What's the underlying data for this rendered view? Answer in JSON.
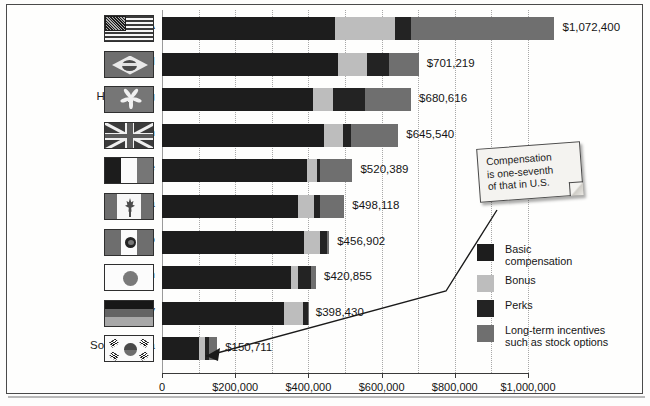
{
  "chart_data": {
    "type": "bar",
    "orientation": "horizontal",
    "stacked": true,
    "title": "",
    "xlabel": "",
    "ylabel": "",
    "xlim": [
      0,
      1100000
    ],
    "grid": true,
    "legend_position": "right",
    "categories": [
      "USA",
      "Brazil",
      "Hong Kong",
      "Britain",
      "France",
      "Canada",
      "Mexico",
      "Japan",
      "Germany",
      "South Korea"
    ],
    "totals": [
      1072400,
      701219,
      680616,
      645540,
      520389,
      498118,
      456902,
      420855,
      398430,
      150711
    ],
    "total_labels": [
      "$1,072,400",
      "$701,219",
      "$680,616",
      "$645,540",
      "$520,389",
      "$498,118",
      "$456,902",
      "$420,855",
      "$398,430",
      "$150,711"
    ],
    "series": [
      {
        "name": "Basic compensation",
        "color": "#1d1d1d",
        "values": [
          472000,
          482000,
          412000,
          442000,
          396000,
          372000,
          388000,
          352000,
          332000,
          100000
        ]
      },
      {
        "name": "Bonus",
        "color": "#bdbdbd",
        "values": [
          166000,
          77000,
          56000,
          52000,
          28000,
          42000,
          44000,
          20000,
          52000,
          18000
        ]
      },
      {
        "name": "Perks",
        "color": "#232323",
        "values": [
          42000,
          61000,
          88000,
          22000,
          8000,
          18000,
          20000,
          36000,
          14000,
          11000
        ]
      },
      {
        "name": "Long-term incentives such as stock options",
        "color": "#6f6f6f",
        "values": [
          392400,
          81219,
          124616,
          129540,
          88389,
          66118,
          4902,
          12855,
          430,
          21711
        ]
      }
    ],
    "x_ticks": [
      0,
      200000,
      400000,
      600000,
      800000,
      1000000
    ],
    "x_tick_labels": [
      "0",
      "$200,000",
      "$400,000",
      "$600,000",
      "$800,000",
      "$1,000,000"
    ]
  },
  "rows": [
    {
      "country": "USA",
      "flag": "flag-usa",
      "value_label": "$1,072,400",
      "total": 1072400,
      "segments": [
        472000,
        166000,
        42000,
        392400
      ]
    },
    {
      "country": "Brazil",
      "flag": "flag-brazil",
      "value_label": "$701,219",
      "total": 701219,
      "segments": [
        482000,
        77000,
        61000,
        81219
      ]
    },
    {
      "country": "Hong Kong",
      "flag": "flag-hong-kong",
      "value_label": "$680,616",
      "total": 680616,
      "segments": [
        412000,
        56000,
        88000,
        124616
      ]
    },
    {
      "country": "Britain",
      "flag": "flag-britain",
      "value_label": "$645,540",
      "total": 645540,
      "segments": [
        442000,
        52000,
        22000,
        129540
      ]
    },
    {
      "country": "France",
      "flag": "flag-france",
      "value_label": "$520,389",
      "total": 520389,
      "segments": [
        396000,
        28000,
        8000,
        88389
      ]
    },
    {
      "country": "Canada",
      "flag": "flag-canada",
      "value_label": "$498,118",
      "total": 498118,
      "segments": [
        372000,
        42000,
        18000,
        66118
      ]
    },
    {
      "country": "Mexico",
      "flag": "flag-mexico",
      "value_label": "$456,902",
      "total": 456902,
      "segments": [
        388000,
        44000,
        20000,
        4902
      ]
    },
    {
      "country": "Japan",
      "flag": "flag-japan",
      "value_label": "$420,855",
      "total": 420855,
      "segments": [
        352000,
        20000,
        36000,
        12855
      ]
    },
    {
      "country": "Germany",
      "flag": "flag-germany",
      "value_label": "$398,430",
      "total": 398430,
      "segments": [
        332000,
        52000,
        14000,
        430
      ]
    },
    {
      "country": "South Korea",
      "flag": "flag-south-korea",
      "value_label": "$150,711",
      "total": 150711,
      "segments": [
        100000,
        18000,
        11000,
        21711
      ]
    }
  ],
  "legend": {
    "items": [
      {
        "label": "Basic\ncompensation",
        "color": "#1d1d1d",
        "swatch_name": "legend-swatch-basic-compensation"
      },
      {
        "label": "Bonus",
        "color": "#bdbdbd",
        "swatch_name": "legend-swatch-bonus"
      },
      {
        "label": "Perks",
        "color": "#232323",
        "swatch_name": "legend-swatch-perks"
      },
      {
        "label": "Long-term incentives\nsuch as stock options",
        "color": "#6f6f6f",
        "swatch_name": "legend-swatch-long-term-incentives"
      }
    ]
  },
  "callout": {
    "text": "Compensation\nis one-seventh\nof that in U.S."
  },
  "axis": {
    "tick_labels": [
      "0",
      "$200,000",
      "$400,000",
      "$600,000",
      "$800,000",
      "$1,000,000"
    ]
  },
  "colors": {
    "basic": "#1d1d1d",
    "bonus": "#bdbdbd",
    "perks": "#232323",
    "long_term": "#6f6f6f",
    "frame": "#4a4a4a",
    "grid": "#a8a8a8"
  }
}
